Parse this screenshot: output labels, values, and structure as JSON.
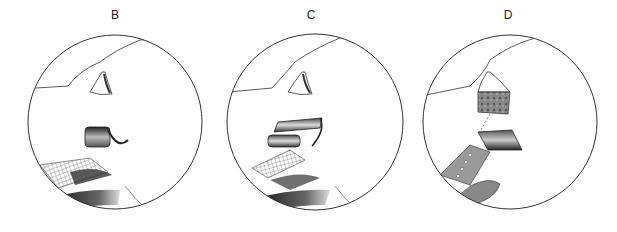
{
  "figure": {
    "panels": [
      {
        "label": "B",
        "description": "Rolled tissue flap lifted from meshed graft near nostril",
        "center": [
          115,
          122
        ],
        "radius": 87
      },
      {
        "label": "C",
        "description": "Folded bilayer flap positioned over meshed graft",
        "center": [
          315,
          122
        ],
        "radius": 88
      },
      {
        "label": "D",
        "description": "Composite graft segment positioned into sutured folded flap",
        "center": [
          510,
          122
        ],
        "radius": 87
      }
    ],
    "colors": {
      "line": "#333333",
      "shade_dark": "#2a2a2a",
      "shade_mid": "#888888",
      "background": "#ffffff"
    }
  }
}
